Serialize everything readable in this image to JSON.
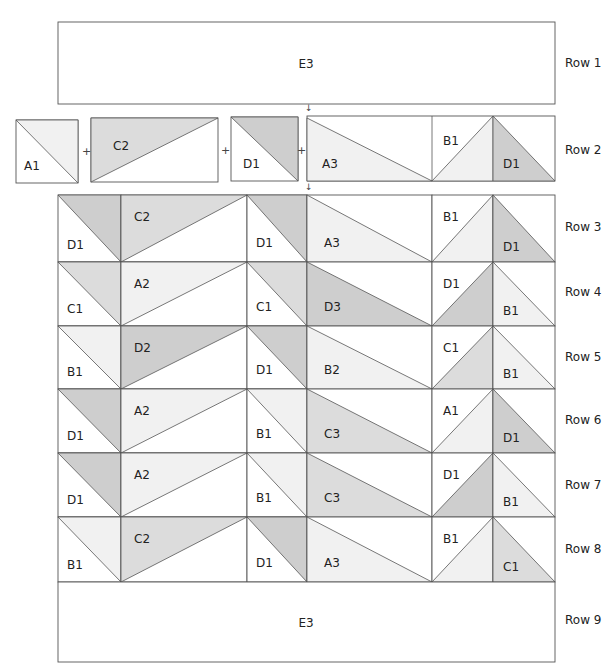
{
  "diagram": {
    "type": "quilt-assembly-diagram",
    "colors": {
      "A": "#f1f1f1",
      "B": "#f1f1f1",
      "C": "#dcdcdc",
      "D": "#cecece",
      "E": "#ffffff",
      "outline": "#555555"
    },
    "row_labels": [
      "Row 1",
      "Row 2",
      "Row 3",
      "Row 4",
      "Row 5",
      "Row 6",
      "Row 7",
      "Row 8",
      "Row 9"
    ],
    "row1": {
      "label": "E3"
    },
    "row2": {
      "units": [
        {
          "label": "A1"
        },
        {
          "label": "C2"
        },
        {
          "label": "D1"
        },
        {
          "labels": [
            "A3",
            "B1",
            "D1"
          ]
        }
      ],
      "joiner": "+",
      "arrow": "↓"
    },
    "grid_rows": [
      {
        "row": "Row 3",
        "pieces": [
          "D1",
          "C2",
          "D1",
          "A3",
          "B1",
          "D1"
        ]
      },
      {
        "row": "Row 4",
        "pieces": [
          "C1",
          "A2",
          "C1",
          "D3",
          "D1",
          "B1"
        ]
      },
      {
        "row": "Row 5",
        "pieces": [
          "B1",
          "D2",
          "D1",
          "B2",
          "C1",
          "B1"
        ]
      },
      {
        "row": "Row 6",
        "pieces": [
          "D1",
          "A2",
          "B1",
          "C3",
          "A1",
          "D1"
        ]
      },
      {
        "row": "Row 7",
        "pieces": [
          "D1",
          "A2",
          "B1",
          "C3",
          "D1",
          "B1"
        ]
      },
      {
        "row": "Row 8",
        "pieces": [
          "B1",
          "C2",
          "D1",
          "A3",
          "B1",
          "C1"
        ]
      }
    ],
    "row9": {
      "label": "E3"
    }
  }
}
